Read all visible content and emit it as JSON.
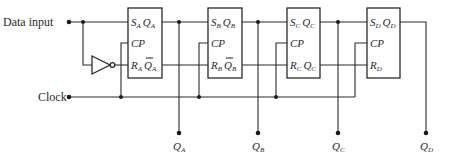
{
  "diagram": {
    "type": "4-bit shift register (RS flip-flops)",
    "inputs": {
      "data_label": "Data input",
      "clock_label": "Clock"
    },
    "flip_flops": [
      {
        "id": "A",
        "s": "S",
        "q": "Q",
        "cp": "CP",
        "r": "R",
        "qbar": "Q",
        "sub": "A",
        "has_qbar": true
      },
      {
        "id": "B",
        "s": "S",
        "q": "Q",
        "cp": "CP",
        "r": "R",
        "qbar": "Q",
        "sub": "B",
        "has_qbar": true
      },
      {
        "id": "C",
        "s": "S",
        "q": "Q",
        "cp": "CP",
        "r": "R",
        "qbar": "Q",
        "sub": "C",
        "has_qbar": true
      },
      {
        "id": "D",
        "s": "S",
        "q": "Q",
        "cp": "CP",
        "r": "R",
        "sub": "D",
        "has_qbar": false
      }
    ],
    "outputs": [
      {
        "label": "Q",
        "sub": "A"
      },
      {
        "label": "Q",
        "sub": "B"
      },
      {
        "label": "Q",
        "sub": "C"
      },
      {
        "label": "Q",
        "sub": "D"
      }
    ],
    "inverter": "NOT gate between data input and R_A",
    "colors": {
      "line": "#2a2a2a",
      "background": "#ffffff"
    }
  }
}
